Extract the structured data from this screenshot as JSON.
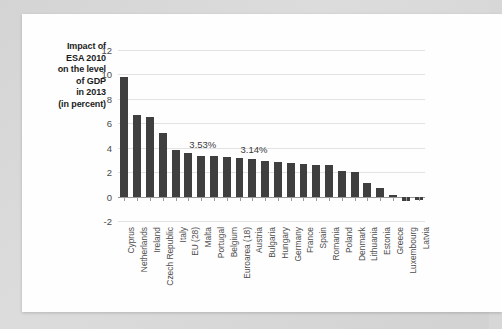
{
  "chart_data": {
    "type": "bar",
    "title": "Impact of ESA 2010 on the level of GDP in 2013 (in percent)",
    "title_lines": [
      "Impact of",
      "ESA 2010",
      "on the level",
      "of GDP",
      "in 2013",
      "(in percent)"
    ],
    "xlabel": "",
    "ylabel": "",
    "ylim": [
      -2,
      12
    ],
    "yticks": [
      -2,
      0,
      2,
      4,
      6,
      8,
      10,
      12
    ],
    "ytick_labels": [
      "-2",
      "0",
      "2",
      "4",
      "6",
      "8",
      "10",
      "12"
    ],
    "grid": true,
    "legend": null,
    "bar_color": "#3f3f3f",
    "categories": [
      "Cyprus",
      "Netherlands",
      "Ireland",
      "Czech Republic",
      "Italy",
      "EU (28)",
      "Malta",
      "Portugal",
      "Belgium",
      "Euroarea (18)",
      "Austria",
      "Bulgaria",
      "Hungary",
      "Germany",
      "France",
      "Spain",
      "Romania",
      "Poland",
      "Denmark",
      "Lithuania",
      "Estonia",
      "Greece",
      "Luxembourg",
      "Latvia"
    ],
    "values": [
      9.8,
      6.65,
      6.55,
      5.2,
      3.8,
      3.53,
      3.3,
      3.3,
      3.25,
      3.14,
      3.1,
      2.95,
      2.8,
      2.75,
      2.7,
      2.6,
      2.55,
      2.1,
      2.05,
      1.1,
      0.7,
      0.15,
      -0.35,
      -0.3
    ],
    "annotations": [
      {
        "text": "3.53%",
        "category": "EU (28)",
        "value": 3.53
      },
      {
        "text": "3.14%",
        "category": "Euroarea (18)",
        "value": 3.14
      }
    ]
  }
}
